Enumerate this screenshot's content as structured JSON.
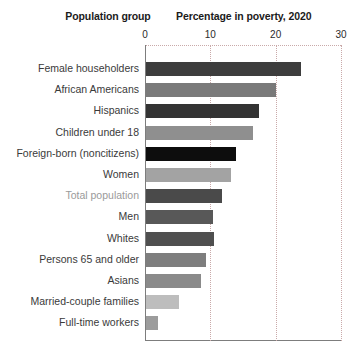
{
  "headers": {
    "group_label": "Population group",
    "value_label": "Percentage in poverty, 2020"
  },
  "chart_data": {
    "type": "bar",
    "orientation": "horizontal",
    "title": "Percentage in poverty, 2020",
    "xlabel": "Percentage in poverty, 2020",
    "ylabel": "Population group",
    "xlim": [
      0,
      30
    ],
    "ticks": [
      0,
      10,
      20,
      30
    ],
    "tick_labels": [
      "0",
      "10",
      "20",
      "30"
    ],
    "grid": "vertical dotted at 10, 20, 30",
    "legend": "none",
    "categories": [
      "Female householders",
      "African Americans",
      "Hispanics",
      "Children under 18",
      "Foreign-born (noncitizens)",
      "Women",
      "Total population",
      "Men",
      "Whites",
      "Persons 65 and older",
      "Asians",
      "Married-couple families",
      "Full-time workers"
    ],
    "values": [
      23.7,
      19.9,
      17.3,
      16.4,
      13.8,
      13.0,
      11.6,
      10.3,
      10.4,
      9.2,
      8.4,
      5.0,
      1.8
    ],
    "bar_colors": [
      "#3d3d3d",
      "#7a7a7a",
      "#333333",
      "#8f8f8f",
      "#0d0d0d",
      "#a3a3a3",
      "#4a4a4a",
      "#585858",
      "#4f4f4f",
      "#7e7e7e",
      "#8a8a8a",
      "#bdbdbd",
      "#9c9c9c"
    ],
    "highlighted_category": "Total population",
    "highlight_label_color": "#9a9a9a"
  },
  "colors": {
    "axis": "#7d7d7d",
    "gridline": "#c9a9a9",
    "label": "#3a3a3a",
    "header": "#1b1b1b",
    "background": "#ffffff"
  }
}
